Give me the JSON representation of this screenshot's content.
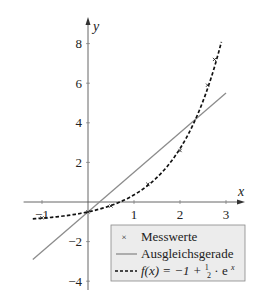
{
  "chart_data": {
    "type": "line",
    "title": "",
    "xlabel": "x",
    "ylabel": "y",
    "xlim": [
      -1.4,
      3.35
    ],
    "ylim": [
      -4.4,
      9.0
    ],
    "x_ticks": [
      -1,
      1,
      2,
      3
    ],
    "y_ticks": [
      -4,
      -2,
      2,
      4,
      6,
      8
    ],
    "x_tick_labels": [
      "−1",
      "1",
      "2",
      "3"
    ],
    "y_tick_labels": [
      "−4",
      "−2",
      "2",
      "4",
      "6",
      "8"
    ],
    "grid": false,
    "legend_position": "lower right",
    "series": [
      {
        "name": "Messwerte",
        "kind": "scatter",
        "marker": "×",
        "x": [
          -1.0,
          0.0,
          0.5,
          1.3,
          2.0,
          2.6,
          2.75
        ],
        "y": [
          -0.8,
          -0.5,
          -0.2,
          0.9,
          2.6,
          5.9,
          7.2
        ]
      },
      {
        "name": "Ausgleichsgerade",
        "kind": "line",
        "style": "solid",
        "color": "#8c8c8c",
        "equation": "y = 2x - 0.5",
        "x": [
          -1.2,
          3.0
        ],
        "y": [
          -2.9,
          5.5
        ]
      },
      {
        "name": "f(x) = −1 + ½ · e^x",
        "kind": "line",
        "style": "dashed",
        "color": "#111111",
        "equation": "f(x) = -1 + 0.5*exp(x)",
        "x_range": [
          -1.2,
          2.9
        ]
      }
    ]
  },
  "axes": {
    "x_label": "x",
    "y_label": "y",
    "x_tick_labels": [
      "−1",
      "1",
      "2",
      "3"
    ],
    "y_tick_labels": [
      "8",
      "6",
      "4",
      "2",
      "−2",
      "−4"
    ]
  },
  "legend": {
    "items": [
      {
        "label": "Messwerte",
        "symbol": "×"
      },
      {
        "label": "Ausgleichsgerade",
        "symbol": "solid-gray-line"
      },
      {
        "label_prefix": "f(x) = −1 + ",
        "frac_num": "1",
        "frac_den": "2",
        "label_suffix": " · e",
        "sup": "x",
        "symbol": "dashed-black-line"
      }
    ],
    "background": "#ececec",
    "border": "#888888"
  }
}
